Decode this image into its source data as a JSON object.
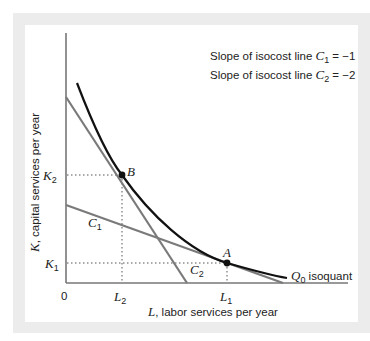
{
  "diagram": {
    "type": "isoquant-isocost",
    "legend": {
      "line1": {
        "prefix": "Slope of isocost line ",
        "var": "C",
        "sub": "1",
        "suffix": " = −1"
      },
      "line2": {
        "prefix": "Slope of isocost line ",
        "var": "C",
        "sub": "2",
        "suffix": " = −2"
      }
    },
    "axes": {
      "y_label_var": "K",
      "y_label_rest": ", capital services per year",
      "x_label_var": "L",
      "x_label_rest": ", labor services per year",
      "origin": "0"
    },
    "ticks": {
      "K2": {
        "var": "K",
        "sub": "2"
      },
      "K1": {
        "var": "K",
        "sub": "1"
      },
      "L2": {
        "var": "L",
        "sub": "2"
      },
      "L1": {
        "var": "L",
        "sub": "1"
      }
    },
    "points": {
      "A": "A",
      "B": "B"
    },
    "lines": {
      "C1": {
        "var": "C",
        "sub": "1",
        "slope": -1
      },
      "C2": {
        "var": "C",
        "sub": "2",
        "slope": -2
      }
    },
    "curve": {
      "var": "Q",
      "sub": "0",
      "text": " isoquant"
    },
    "colors": {
      "isoquant": "#111111",
      "isocost": "#7a7a7a",
      "axis": "#777777",
      "frame": "#ececec"
    }
  }
}
